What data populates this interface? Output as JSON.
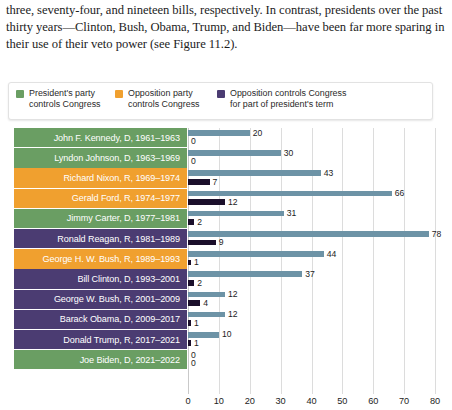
{
  "prose": {
    "paragraph": "three, seventy-four, and nineteen bills, respectively. In contrast, presidents over the past thirty years—Clinton, Bush, Obama, Trump, and Biden—have been far more sparing in their use of their veto power (see Figure 11.2)."
  },
  "legend": {
    "items": [
      {
        "label": "President's party\ncontrols Congress",
        "color": "#6a9e63",
        "key": "president-party"
      },
      {
        "label": "Opposition party\ncontrols Congress",
        "color": "#f0a02f",
        "key": "opposition-party"
      },
      {
        "label": "Opposition controls Congress\nfor part of president's term",
        "color": "#4b3c72",
        "key": "opposition-partial"
      }
    ]
  },
  "colors": {
    "green": "#6a9e63",
    "orange": "#f0a02f",
    "purple": "#4b3c72",
    "bar_primary": "#6d93a6",
    "bar_secondary": "#1b0f2b",
    "gridline": "#dcdcdc"
  },
  "chart_data": {
    "type": "bar",
    "orientation": "horizontal",
    "title": "",
    "xlabel": "",
    "ylabel": "",
    "xlim": [
      0,
      80
    ],
    "xticks": [
      0,
      10,
      20,
      30,
      40,
      50,
      60,
      70,
      80
    ],
    "grid": true,
    "legend_position": "top",
    "categories": [
      "John F. Kennedy, D, 1961–1963",
      "Lyndon Johnson, D, 1963–1969",
      "Richard Nixon, R, 1969–1974",
      "Gerald Ford, R, 1974–1977",
      "Jimmy Carter, D, 1977–1981",
      "Ronald Reagan, R, 1981–1989",
      "George H. W. Bush, R, 1989–1993",
      "Bill Clinton, D, 1993–2001",
      "George W. Bush, R, 2001–2009",
      "Barack Obama, D, 2009–2017",
      "Donald Trump, R, 2017–2021",
      "Joe Biden, D, 2021–2022"
    ],
    "series": [
      {
        "name": "bar-primary",
        "color": "#6d93a6",
        "values": [
          20,
          30,
          43,
          66,
          31,
          78,
          44,
          37,
          12,
          12,
          10,
          0
        ]
      },
      {
        "name": "bar-secondary",
        "color": "#1b0f2b",
        "values": [
          0,
          0,
          7,
          12,
          2,
          9,
          1,
          2,
          4,
          1,
          1,
          0
        ]
      }
    ],
    "category_groups": [
      "president-party",
      "president-party",
      "opposition-party",
      "opposition-party",
      "president-party",
      "opposition-partial",
      "opposition-party",
      "opposition-partial",
      "opposition-partial",
      "opposition-partial",
      "opposition-partial",
      "president-party"
    ]
  }
}
